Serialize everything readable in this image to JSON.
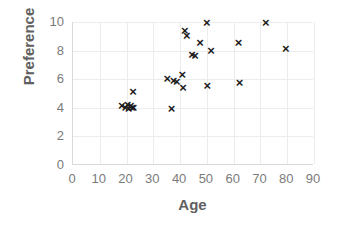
{
  "chart_data": {
    "type": "scatter",
    "title": "",
    "xlabel": "Age",
    "ylabel": "Preference",
    "xlim": [
      0,
      90
    ],
    "ylim": [
      0,
      10
    ],
    "xticks": [
      0,
      10,
      20,
      30,
      40,
      50,
      60,
      70,
      80,
      90
    ],
    "yticks": [
      0,
      2,
      4,
      6,
      8,
      10
    ],
    "grid": true,
    "legend": null,
    "marker": "x",
    "marker_color": "#1c1c1c",
    "grid_color": "#ececec",
    "axis_color": "#d9d9d9",
    "tick_label_color": "#7b7b7b",
    "axis_title_color": "#606060",
    "points": [
      {
        "x": 18.0,
        "y": 4.1
      },
      {
        "x": 19.3,
        "y": 4.0
      },
      {
        "x": 20.2,
        "y": 4.2
      },
      {
        "x": 20.6,
        "y": 3.9
      },
      {
        "x": 21.4,
        "y": 4.1
      },
      {
        "x": 21.9,
        "y": 4.0
      },
      {
        "x": 22.2,
        "y": 5.1
      },
      {
        "x": 22.4,
        "y": 4.0
      },
      {
        "x": 35.0,
        "y": 6.0
      },
      {
        "x": 36.6,
        "y": 3.9
      },
      {
        "x": 37.4,
        "y": 5.9
      },
      {
        "x": 38.6,
        "y": 5.8
      },
      {
        "x": 40.6,
        "y": 6.3
      },
      {
        "x": 40.9,
        "y": 5.4
      },
      {
        "x": 41.6,
        "y": 9.4
      },
      {
        "x": 42.3,
        "y": 9.0
      },
      {
        "x": 44.3,
        "y": 7.7
      },
      {
        "x": 45.4,
        "y": 7.6
      },
      {
        "x": 47.3,
        "y": 8.5
      },
      {
        "x": 49.8,
        "y": 9.9
      },
      {
        "x": 51.4,
        "y": 8.0
      },
      {
        "x": 50.0,
        "y": 5.5
      },
      {
        "x": 61.6,
        "y": 8.5
      },
      {
        "x": 62.0,
        "y": 5.7
      },
      {
        "x": 71.8,
        "y": 9.9
      },
      {
        "x": 79.3,
        "y": 8.1
      }
    ]
  }
}
